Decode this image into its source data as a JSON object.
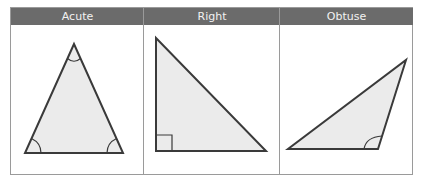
{
  "figure": {
    "columns": [
      {
        "label": "Acute",
        "description": "All three angles less than 90°"
      },
      {
        "label": "Right",
        "description": "One angle equal to 90°"
      },
      {
        "label": "Obtuse",
        "description": "One angle greater than 90°"
      }
    ]
  },
  "colors": {
    "header_bg": "#6b6b6b",
    "header_text": "#f2f2f2",
    "triangle_fill": "#ebebeb",
    "triangle_stroke": "#3a3a3a",
    "grid_lines": "#9a9a9a"
  }
}
